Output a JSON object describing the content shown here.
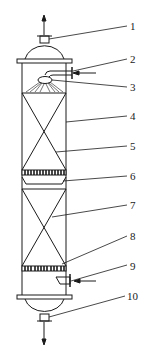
{
  "diagram": {
    "type": "packed-column",
    "colors": {
      "stroke": "#1a1a1a",
      "background": "#ffffff"
    },
    "labels": [
      {
        "id": "1",
        "text": "1",
        "x": 130,
        "y": 21
      },
      {
        "id": "2",
        "text": "2",
        "x": 130,
        "y": 54
      },
      {
        "id": "3",
        "text": "3",
        "x": 130,
        "y": 82
      },
      {
        "id": "4",
        "text": "4",
        "x": 130,
        "y": 111
      },
      {
        "id": "5",
        "text": "5",
        "x": 130,
        "y": 141
      },
      {
        "id": "6",
        "text": "6",
        "x": 130,
        "y": 171
      },
      {
        "id": "7",
        "text": "7",
        "x": 130,
        "y": 200
      },
      {
        "id": "8",
        "text": "8",
        "x": 130,
        "y": 231
      },
      {
        "id": "9",
        "text": "9",
        "x": 130,
        "y": 261
      },
      {
        "id": "10",
        "text": "10",
        "x": 127,
        "y": 291
      }
    ]
  }
}
